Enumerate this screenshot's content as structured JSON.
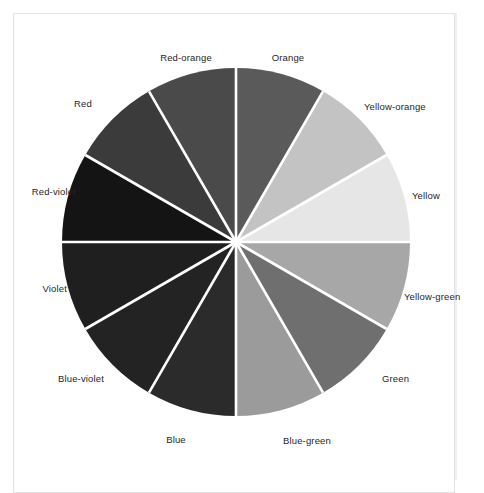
{
  "page": {
    "background_color": "#ffffff",
    "frame_color": "#e3e3e3"
  },
  "figure": {
    "title": "",
    "type": "color-wheel",
    "center_x": 236,
    "center_y": 242,
    "radius": 174,
    "separator_color": "#ffffff",
    "separator_width": 2.6,
    "label_color": "#262626"
  },
  "chart_data": {
    "type": "pie",
    "title": "",
    "xlabel": "",
    "ylabel": "",
    "legend_position": "outside-radial",
    "grid": false,
    "equal_slices": true,
    "slice_count": 12,
    "slice_degrees": 30,
    "start_angle_deg": 0,
    "direction": "clockwise",
    "categories": [
      "Orange",
      "Yellow-orange",
      "Yellow",
      "Yellow-green",
      "Green",
      "Blue-green",
      "Blue",
      "Blue-violet",
      "Violet",
      "Red-violet",
      "Red",
      "Red-orange"
    ],
    "values": [
      30,
      30,
      30,
      30,
      30,
      30,
      30,
      30,
      30,
      30,
      30,
      30
    ],
    "colors": [
      "#5a5a5a",
      "#c3c3c3",
      "#e6e6e6",
      "#a7a7a7",
      "#6f6f6f",
      "#9b9b9b",
      "#2b2b2b",
      "#232323",
      "#1f1f1f",
      "#141414",
      "#3b3b3b",
      "#4a4a4a"
    ],
    "segments": [
      {
        "label": "Orange",
        "start_deg": 0,
        "end_deg": 30,
        "color": "#5a5a5a",
        "label_x": 288,
        "label_y": 58,
        "align": "center"
      },
      {
        "label": "Yellow-orange",
        "start_deg": 30,
        "end_deg": 60,
        "color": "#c3c3c3",
        "label_x": 364,
        "label_y": 107,
        "align": "left"
      },
      {
        "label": "Yellow",
        "start_deg": 60,
        "end_deg": 90,
        "color": "#e6e6e6",
        "label_x": 412,
        "label_y": 196,
        "align": "left"
      },
      {
        "label": "Yellow-green",
        "start_deg": 90,
        "end_deg": 120,
        "color": "#a7a7a7",
        "label_x": 404,
        "label_y": 297,
        "align": "left"
      },
      {
        "label": "Green",
        "start_deg": 120,
        "end_deg": 150,
        "color": "#6f6f6f",
        "label_x": 382,
        "label_y": 379,
        "align": "left"
      },
      {
        "label": "Blue-green",
        "start_deg": 150,
        "end_deg": 180,
        "color": "#9b9b9b",
        "label_x": 307,
        "label_y": 441,
        "align": "center"
      },
      {
        "label": "Blue",
        "start_deg": 180,
        "end_deg": 210,
        "color": "#2b2b2b",
        "label_x": 176,
        "label_y": 440,
        "align": "center"
      },
      {
        "label": "Blue-violet",
        "start_deg": 210,
        "end_deg": 240,
        "color": "#232323",
        "label_x": 104,
        "label_y": 379,
        "align": "right"
      },
      {
        "label": "Violet",
        "start_deg": 240,
        "end_deg": 270,
        "color": "#1f1f1f",
        "label_x": 67,
        "label_y": 289,
        "align": "right"
      },
      {
        "label": "Red-violet",
        "start_deg": 270,
        "end_deg": 300,
        "color": "#141414",
        "label_x": 76,
        "label_y": 192,
        "align": "right"
      },
      {
        "label": "Red",
        "start_deg": 300,
        "end_deg": 330,
        "color": "#3b3b3b",
        "label_x": 92,
        "label_y": 104,
        "align": "right"
      },
      {
        "label": "Red-orange",
        "start_deg": 330,
        "end_deg": 360,
        "color": "#4a4a4a",
        "label_x": 186,
        "label_y": 58,
        "align": "center"
      }
    ]
  }
}
